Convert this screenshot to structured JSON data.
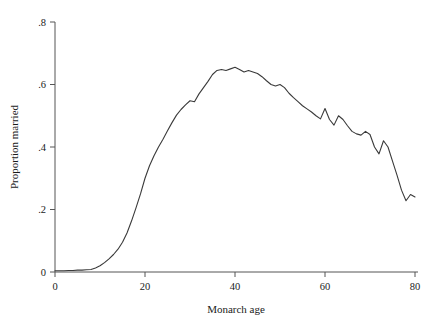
{
  "chart_data": {
    "type": "line",
    "title": "",
    "subtitle": "",
    "xlabel": "Monarch age",
    "ylabel": "Proportion married",
    "xlim": [
      0,
      80
    ],
    "ylim": [
      0,
      0.8
    ],
    "grid": false,
    "legend": null,
    "legend_position": "none",
    "xticks": [
      0,
      20,
      40,
      60,
      80
    ],
    "xtick_labels": [
      "0",
      "20",
      "40",
      "60",
      "80"
    ],
    "yticks": [
      0,
      0.2,
      0.4,
      0.6,
      0.8
    ],
    "ytick_labels": [
      "0",
      ".2",
      ".4",
      ".6",
      ".8"
    ],
    "line_color": "#3a3a3a",
    "series": [
      {
        "name": "Proportion married",
        "x": [
          0,
          1,
          2,
          3,
          4,
          5,
          6,
          7,
          8,
          9,
          10,
          11,
          12,
          13,
          14,
          15,
          16,
          17,
          18,
          19,
          20,
          21,
          22,
          23,
          24,
          25,
          26,
          27,
          28,
          29,
          30,
          31,
          32,
          33,
          34,
          35,
          36,
          37,
          38,
          39,
          40,
          41,
          42,
          43,
          44,
          45,
          46,
          47,
          48,
          49,
          50,
          51,
          52,
          53,
          54,
          55,
          56,
          57,
          58,
          59,
          60,
          61,
          62,
          63,
          64,
          65,
          66,
          67,
          68,
          69,
          70,
          71,
          72,
          73,
          74,
          75,
          76,
          77,
          78,
          79,
          80
        ],
        "y": [
          0.004,
          0.004,
          0.004,
          0.005,
          0.005,
          0.006,
          0.006,
          0.007,
          0.008,
          0.013,
          0.02,
          0.03,
          0.042,
          0.056,
          0.073,
          0.095,
          0.125,
          0.163,
          0.205,
          0.25,
          0.3,
          0.34,
          0.372,
          0.4,
          0.425,
          0.452,
          0.478,
          0.502,
          0.52,
          0.535,
          0.548,
          0.545,
          0.57,
          0.59,
          0.61,
          0.632,
          0.645,
          0.648,
          0.645,
          0.65,
          0.655,
          0.648,
          0.64,
          0.645,
          0.64,
          0.635,
          0.625,
          0.612,
          0.6,
          0.595,
          0.6,
          0.59,
          0.572,
          0.558,
          0.545,
          0.532,
          0.522,
          0.512,
          0.5,
          0.49,
          0.523,
          0.488,
          0.47,
          0.5,
          0.488,
          0.468,
          0.45,
          0.442,
          0.438,
          0.45,
          0.44,
          0.4,
          0.378,
          0.42,
          0.4,
          0.355,
          0.31,
          0.262,
          0.228,
          0.248,
          0.24
        ]
      }
    ]
  }
}
